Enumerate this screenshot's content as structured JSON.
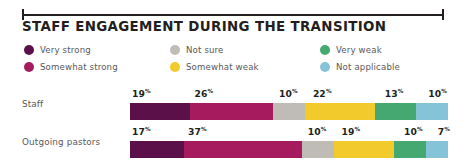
{
  "header": {
    "title": "STAFF ENGAGEMENT DURING THE TRANSITION",
    "rule_icon": "measure-rule-icon"
  },
  "legend": {
    "columns": [
      [
        {
          "label": "Very strong",
          "color": "#5c1049",
          "key": "very_strong"
        },
        {
          "label": "Somewhat strong",
          "color": "#a51b5e",
          "key": "somewhat_strong"
        }
      ],
      [
        {
          "label": "Not sure",
          "color": "#bfbcb6",
          "key": "not_sure"
        },
        {
          "label": "Somewhat weak",
          "color": "#f2ca2b",
          "key": "somewhat_weak"
        }
      ],
      [
        {
          "label": "Very weak",
          "color": "#45a871",
          "key": "very_weak"
        },
        {
          "label": "Not applicable",
          "color": "#85c3d9",
          "key": "not_applicable"
        }
      ]
    ]
  },
  "chart_data": {
    "type": "bar",
    "title": "STAFF ENGAGEMENT DURING THE TRANSITION",
    "xlabel": "",
    "ylabel": "",
    "orientation": "horizontal",
    "stacked": true,
    "units": "%",
    "grid": false,
    "legend_position": "top",
    "categories": [
      "Staff",
      "Outgoing pastors"
    ],
    "series": [
      {
        "name": "Very strong",
        "color": "#5c1049",
        "values": [
          19,
          17
        ]
      },
      {
        "name": "Somewhat strong",
        "color": "#a51b5e",
        "values": [
          26,
          37
        ]
      },
      {
        "name": "Not sure",
        "color": "#bfbcb6",
        "values": [
          10,
          10
        ]
      },
      {
        "name": "Somewhat weak",
        "color": "#f2ca2b",
        "values": [
          22,
          19
        ]
      },
      {
        "name": "Very weak",
        "color": "#45a871",
        "values": [
          13,
          10
        ]
      },
      {
        "name": "Not applicable",
        "color": "#85c3d9",
        "values": [
          10,
          7
        ]
      }
    ],
    "rows": [
      {
        "label": "Staff",
        "segments": [
          {
            "name": "Very strong",
            "value": 19,
            "display": "19",
            "suffix": "%",
            "color": "#5c1049"
          },
          {
            "name": "Somewhat strong",
            "value": 26,
            "display": "26",
            "suffix": "%",
            "color": "#a51b5e"
          },
          {
            "name": "Not sure",
            "value": 10,
            "display": "10",
            "suffix": "%",
            "color": "#bfbcb6"
          },
          {
            "name": "Somewhat weak",
            "value": 22,
            "display": "22",
            "suffix": "%",
            "color": "#f2ca2b"
          },
          {
            "name": "Very weak",
            "value": 13,
            "display": "13",
            "suffix": "%",
            "color": "#45a871"
          },
          {
            "name": "Not applicable",
            "value": 10,
            "display": "10",
            "suffix": "%",
            "color": "#85c3d9"
          }
        ]
      },
      {
        "label": "Outgoing pastors",
        "segments": [
          {
            "name": "Very strong",
            "value": 17,
            "display": "17",
            "suffix": "%",
            "color": "#5c1049"
          },
          {
            "name": "Somewhat strong",
            "value": 37,
            "display": "37",
            "suffix": "%",
            "color": "#a51b5e"
          },
          {
            "name": "Not sure",
            "value": 10,
            "display": "10",
            "suffix": "%",
            "color": "#bfbcb6"
          },
          {
            "name": "Somewhat weak",
            "value": 19,
            "display": "19",
            "suffix": "%",
            "color": "#f2ca2b"
          },
          {
            "name": "Very weak",
            "value": 10,
            "display": "10",
            "suffix": "%",
            "color": "#45a871"
          },
          {
            "name": "Not applicable",
            "value": 7,
            "display": "7",
            "suffix": "%",
            "color": "#85c3d9"
          }
        ]
      }
    ]
  },
  "colors": {
    "text_dark": "#231f20",
    "text_muted": "#58595b",
    "background": "#ffffff"
  }
}
